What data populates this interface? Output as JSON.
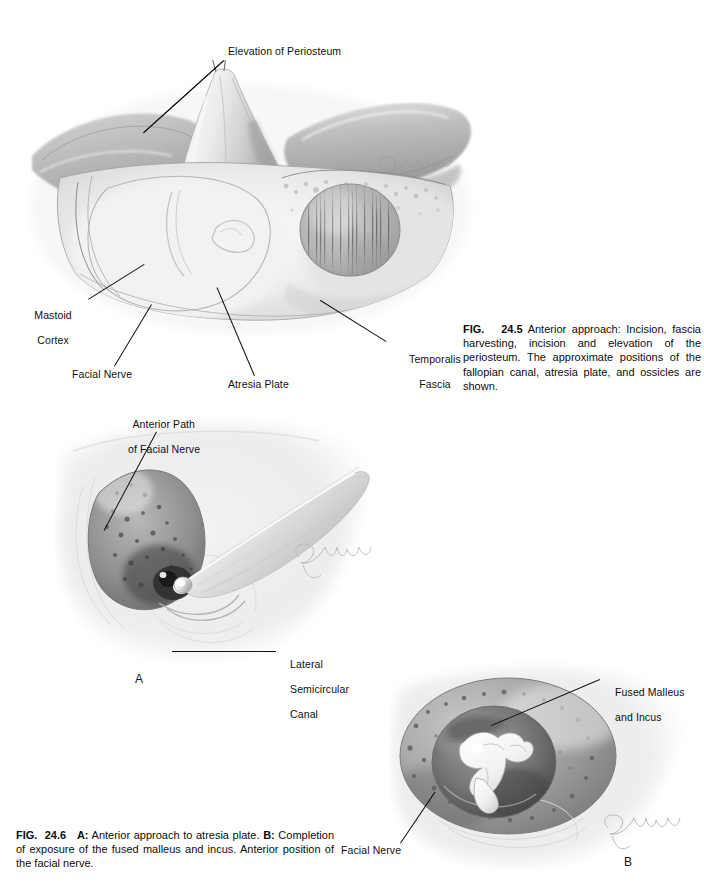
{
  "page": {
    "background": "#ffffff",
    "ink": "#111111"
  },
  "figures": [
    {
      "id": "fig-24-5",
      "labels": [
        {
          "name": "label-elevation-of-periosteum",
          "text": "Elevation of Periosteum"
        },
        {
          "name": "label-mastoid-cortex",
          "text": "Mastoid\nCortex"
        },
        {
          "name": "label-facial-nerve",
          "text": "Facial Nerve"
        },
        {
          "name": "label-atresia-plate",
          "text": "Atresia Plate"
        },
        {
          "name": "label-temporalis-fascia",
          "text": "Temporalis\nFascia"
        }
      ],
      "caption": {
        "number_prefix": "FIG.",
        "number": "24.5",
        "body": "Anterior approach: Incision, fascia harvesting, incision and elevation of the periosteum. The approximate positions of the fallopian canal, atresia plate, and ossicles are shown."
      }
    },
    {
      "id": "fig-24-6",
      "panels": [
        {
          "letter": "A",
          "name": "panel-letter-a"
        },
        {
          "letter": "B",
          "name": "panel-letter-b"
        }
      ],
      "labels": [
        {
          "name": "label-anterior-path-of-facial-nerve",
          "text": "Anterior Path\nof Facial Nerve"
        },
        {
          "name": "label-lateral-semicircular-canal",
          "text": "Lateral\nSemicircular\nCanal"
        },
        {
          "name": "label-fused-malleus-and-incus",
          "text": "Fused Malleus\nand Incus"
        },
        {
          "name": "label-facial-nerve-b",
          "text": "Facial Nerve"
        }
      ],
      "caption": {
        "number_prefix": "FIG.",
        "number": "24.6",
        "part_a_label": "A:",
        "part_a_text": "Anterior approach to atresia plate.",
        "part_b_label": "B:",
        "part_b_text": "Completion of exposure of the fused malleus and incus. Anterior position of the facial nerve."
      }
    }
  ],
  "artist_signature": "Gilla"
}
